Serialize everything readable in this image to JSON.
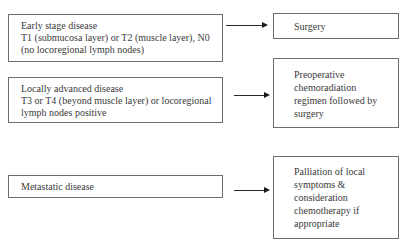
{
  "diagram": {
    "type": "flowchart",
    "stages": [
      {
        "label": "Early stage disease",
        "detail_lines": [
          "T1 (submucosa layer) or T2 (muscle layer), N0",
          "(no locoregional lymph nodes)"
        ],
        "treatment_lines": [
          "Surgery"
        ]
      },
      {
        "label": "Locally advanced disease",
        "detail_lines": [
          "T3 or T4 (beyond muscle layer) or locoregional",
          "lymph nodes positive"
        ],
        "treatment_lines": [
          "Preoperative",
          "chemoradiation",
          "regimen followed by",
          "surgery"
        ]
      },
      {
        "label": "Metastatic disease",
        "detail_lines": [],
        "treatment_lines": [
          "Palliation of local",
          "symptoms &",
          "consideration",
          "chemotherapy if",
          "appropriate"
        ]
      }
    ],
    "edges": [
      {
        "from": "Early stage disease",
        "to": "Surgery"
      },
      {
        "from": "Locally advanced disease",
        "to": "Preoperative chemoradiation regimen followed by surgery"
      },
      {
        "from": "Metastatic disease",
        "to": "Palliation of local symptoms & consideration chemotherapy if appropriate"
      }
    ]
  }
}
